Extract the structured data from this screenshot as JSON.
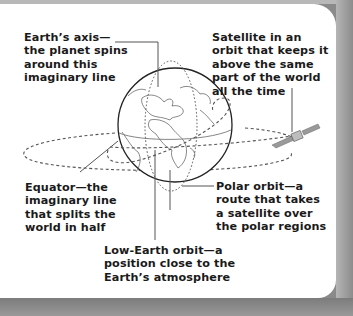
{
  "diagram": {
    "labels": {
      "earth_axis": "Earth’s axis—\nthe planet spins\naround this\nimaginary line",
      "geo_satellite": "Satellite in an\norbit that keeps it\nabove the same\npart of the world\nall the time",
      "equator": "Equator—the\nimaginary line\nthat splits the\nworld in half",
      "polar_orbit": "Polar orbit—a\nroute that takes\na satellite over\nthe polar regions",
      "low_earth_orbit": "Low-Earth orbit—a\nposition close to the\nEarth’s atmosphere"
    },
    "colors": {
      "text": "#1a1a1a",
      "line": "#555555",
      "card": "#ffffff",
      "backdrop": "#8a8a8a"
    }
  }
}
